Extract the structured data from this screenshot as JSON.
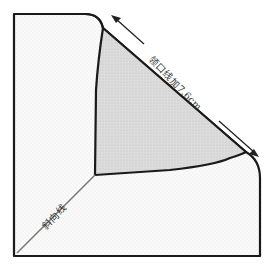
{
  "diagram": {
    "type": "sewing-pattern-fold",
    "labels": {
      "neckline": "领口线加7.6cm",
      "bias_line": "斜向线"
    },
    "colors": {
      "outline": "#1a1a1a",
      "fabric_fill": "#f7f7f7",
      "folded_fill": "#d9d9d9",
      "bias_line": "#7a7a7a",
      "arrow": "#222222",
      "text": "#333333"
    },
    "annotations": {
      "arrow_direction": "double-headed along fold edge"
    }
  }
}
